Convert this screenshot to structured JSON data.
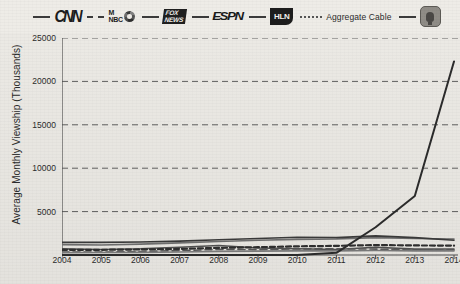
{
  "legend": {
    "items": [
      {
        "id": "cnn",
        "label": "CNN",
        "mark": "brand-cnn",
        "line": "solid",
        "color": "#3b3b3b"
      },
      {
        "id": "msnbc",
        "label": "MSNBC",
        "mark": "brand-msnbc",
        "line": "dashed",
        "color": "#4a4a4a"
      },
      {
        "id": "foxnews",
        "label": "FOX NEWS",
        "mark": "brand-fox",
        "line": "solid",
        "color": "#555555"
      },
      {
        "id": "espn",
        "label": "ESPN",
        "mark": "brand-espn",
        "line": "solid",
        "color": "#2f2f2f"
      },
      {
        "id": "hln",
        "label": "HLN",
        "mark": "brand-hln",
        "line": "solid",
        "color": "#3d3d3d"
      },
      {
        "id": "aggregate-cable",
        "label": "Aggregate Cable",
        "mark": "text",
        "line": "dotted",
        "color": "#555555"
      },
      {
        "id": "podcast",
        "label": "Podcast",
        "mark": "brand-pod",
        "line": "solid",
        "color": "#2b2b2b"
      }
    ],
    "fox_line1": "FOX",
    "fox_line2": "NEWS",
    "msnbc_m": "M",
    "msnbc_s": "S",
    "msnbc_nbc": "NBC",
    "espn_text": "ESPN",
    "hln_text": "HLN",
    "cnn_text": "CNN",
    "aggregate_text": "Aggregate Cable"
  },
  "axes": {
    "ylabel": "Average Monthly Viewship (Thousands)",
    "yticks": [
      "25000",
      "20000",
      "15000",
      "10000",
      "5000"
    ],
    "xticks": [
      "2004",
      "2005",
      "2006",
      "2007",
      "2008",
      "2009",
      "2010",
      "2011",
      "2012",
      "2013",
      "2014"
    ]
  },
  "chart_data": {
    "type": "line",
    "title": "",
    "xlabel": "",
    "ylabel": "Average Monthly Viewship (Thousands)",
    "x": [
      2004,
      2005,
      2006,
      2007,
      2008,
      2009,
      2010,
      2011,
      2012,
      2013,
      2014
    ],
    "ylim": [
      0,
      25000
    ],
    "xlim": [
      2004,
      2014
    ],
    "grid": "horizontal-dashed",
    "legend_position": "top",
    "series": [
      {
        "name": "CNN",
        "style": "solid",
        "color": "#4f4f4f",
        "values": [
          700,
          640,
          720,
          900,
          1100,
          800,
          720,
          640,
          900,
          680,
          690
        ]
      },
      {
        "name": "MSNBC",
        "style": "dashed",
        "color": "#555555",
        "values": [
          330,
          330,
          400,
          500,
          650,
          620,
          700,
          720,
          680,
          570,
          590
        ]
      },
      {
        "name": "FOX NEWS",
        "style": "solid",
        "color": "#6d6d6d",
        "values": [
          1200,
          1150,
          1250,
          1400,
          1550,
          1700,
          1800,
          1850,
          2000,
          1900,
          1850
        ]
      },
      {
        "name": "ESPN",
        "style": "solid",
        "color": "#3a3a3a",
        "values": [
          1450,
          1450,
          1500,
          1600,
          1750,
          1900,
          2050,
          2000,
          2200,
          2000,
          1700
        ]
      },
      {
        "name": "HLN",
        "style": "solid",
        "color": "#7a7a7a",
        "values": [
          270,
          280,
          300,
          350,
          420,
          450,
          470,
          480,
          520,
          480,
          470
        ]
      },
      {
        "name": "Aggregate Cable",
        "style": "dotted",
        "color": "#2e2e2e",
        "values": [
          600,
          600,
          640,
          700,
          820,
          900,
          1000,
          1050,
          1150,
          1100,
          1080
        ]
      },
      {
        "name": "Podcast",
        "style": "solid",
        "color": "#2b2b2b",
        "values": [
          0,
          0,
          0,
          0,
          0,
          0,
          0,
          250,
          3200,
          6800,
          22300
        ]
      }
    ]
  }
}
